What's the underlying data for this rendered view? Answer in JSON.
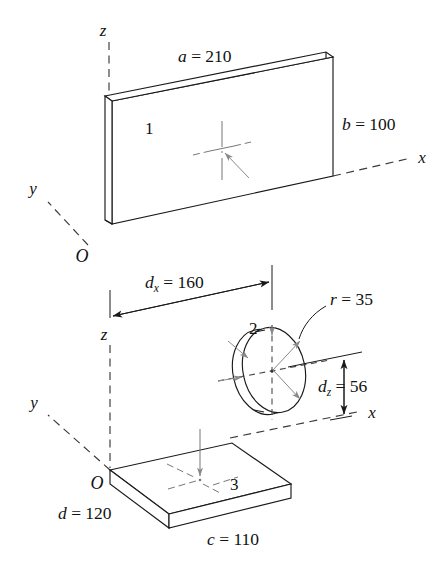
{
  "figure": {
    "background_color": "#ffffff",
    "line_color": "#1a1a1a",
    "dashed_axis_color": "#3a3a3a",
    "centermark_color": "#777777"
  },
  "upper_figure": {
    "part_label": "1",
    "origin_label": "O",
    "axes": {
      "x_label": "x",
      "y_label": "y",
      "z_label": "z"
    },
    "dimensions": [
      {
        "id": "a",
        "symbol": "a",
        "equals": "=",
        "value": "210",
        "text": "a = 210"
      },
      {
        "id": "b",
        "symbol": "b",
        "equals": "=",
        "value": "100",
        "text": "b = 100"
      }
    ]
  },
  "lower_figure": {
    "disk_label": "2",
    "plate_label": "3",
    "origin_label": "O",
    "axes": {
      "x_label": "x",
      "y_label": "y",
      "z_label": "z"
    },
    "dimensions": [
      {
        "id": "dx",
        "symbol": "d",
        "subscript": "x",
        "equals": "=",
        "value": "160",
        "text": "d_x = 160"
      },
      {
        "id": "dz",
        "symbol": "d",
        "subscript": "z",
        "equals": "=",
        "value": "56",
        "text": "d_z = 56"
      },
      {
        "id": "r",
        "symbol": "r",
        "equals": "=",
        "value": "35",
        "text": "r = 35"
      },
      {
        "id": "c",
        "symbol": "c",
        "equals": "=",
        "value": "110",
        "text": "c = 110"
      },
      {
        "id": "d",
        "symbol": "d",
        "equals": "=",
        "value": "120",
        "text": "d = 120"
      }
    ]
  }
}
